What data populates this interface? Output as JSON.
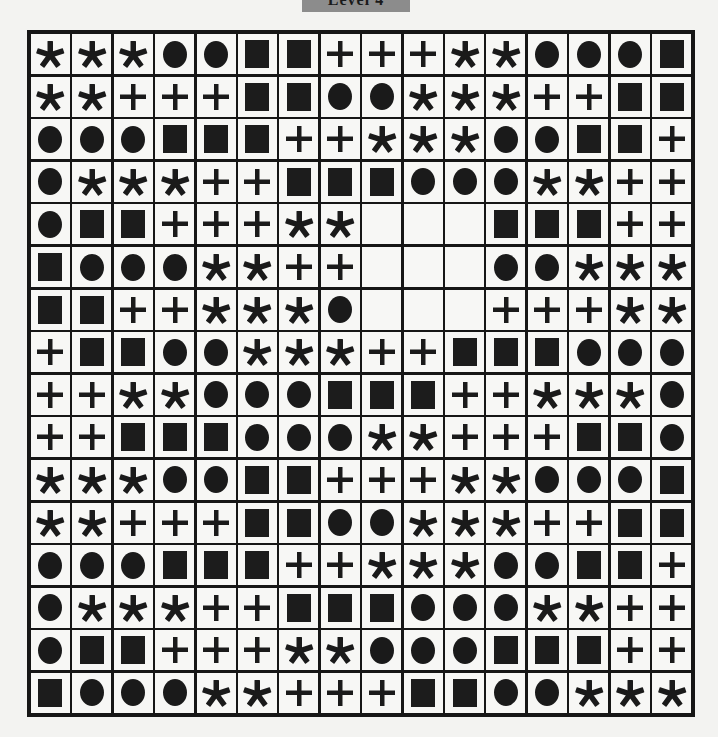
{
  "header": {
    "level_label": "Level 4"
  },
  "board": {
    "rows": 16,
    "cols": 16,
    "legend": {
      "C": "circle",
      "S": "square",
      "P": "plus",
      "A": "asterisk",
      "_": "empty"
    },
    "grid": [
      [
        "A",
        "A",
        "A",
        "C",
        "C",
        "S",
        "S",
        "P",
        "P",
        "P",
        "A",
        "A",
        "C",
        "C",
        "C",
        "S"
      ],
      [
        "A",
        "A",
        "P",
        "P",
        "P",
        "S",
        "S",
        "C",
        "C",
        "A",
        "A",
        "A",
        "P",
        "P",
        "S",
        "S"
      ],
      [
        "C",
        "C",
        "C",
        "S",
        "S",
        "S",
        "P",
        "P",
        "A",
        "A",
        "A",
        "C",
        "C",
        "S",
        "S",
        "P"
      ],
      [
        "C",
        "A",
        "A",
        "A",
        "P",
        "P",
        "S",
        "S",
        "S",
        "C",
        "C",
        "C",
        "A",
        "A",
        "P",
        "P"
      ],
      [
        "C",
        "S",
        "S",
        "P",
        "P",
        "P",
        "A",
        "A",
        "_",
        "_",
        "_",
        "S",
        "S",
        "S",
        "P",
        "P"
      ],
      [
        "S",
        "C",
        "C",
        "C",
        "A",
        "A",
        "P",
        "P",
        "_",
        "_",
        "_",
        "C",
        "C",
        "A",
        "A",
        "A"
      ],
      [
        "S",
        "S",
        "P",
        "P",
        "A",
        "A",
        "A",
        "C",
        "_",
        "_",
        "_",
        "P",
        "P",
        "P",
        "A",
        "A"
      ],
      [
        "P",
        "S",
        "S",
        "C",
        "C",
        "A",
        "A",
        "A",
        "P",
        "P",
        "S",
        "S",
        "S",
        "C",
        "C",
        "C"
      ],
      [
        "P",
        "P",
        "A",
        "A",
        "C",
        "C",
        "C",
        "S",
        "S",
        "S",
        "P",
        "P",
        "A",
        "A",
        "A",
        "C"
      ],
      [
        "P",
        "P",
        "S",
        "S",
        "S",
        "C",
        "C",
        "C",
        "A",
        "A",
        "P",
        "P",
        "P",
        "S",
        "S",
        "C"
      ],
      [
        "A",
        "A",
        "A",
        "C",
        "C",
        "S",
        "S",
        "P",
        "P",
        "P",
        "A",
        "A",
        "C",
        "C",
        "C",
        "S"
      ],
      [
        "A",
        "A",
        "P",
        "P",
        "P",
        "S",
        "S",
        "C",
        "C",
        "A",
        "A",
        "A",
        "P",
        "P",
        "S",
        "S"
      ],
      [
        "C",
        "C",
        "C",
        "S",
        "S",
        "S",
        "P",
        "P",
        "A",
        "A",
        "A",
        "C",
        "C",
        "S",
        "S",
        "P"
      ],
      [
        "C",
        "A",
        "A",
        "A",
        "P",
        "P",
        "S",
        "S",
        "S",
        "C",
        "C",
        "C",
        "A",
        "A",
        "P",
        "P"
      ],
      [
        "C",
        "S",
        "S",
        "P",
        "P",
        "P",
        "A",
        "A",
        "C",
        "C",
        "C",
        "S",
        "S",
        "S",
        "P",
        "P"
      ],
      [
        "S",
        "C",
        "C",
        "C",
        "A",
        "A",
        "P",
        "P",
        "P",
        "S",
        "S",
        "C",
        "C",
        "A",
        "A",
        "A"
      ]
    ],
    "missing_region": {
      "rows": [
        5,
        6,
        7
      ],
      "cols": [
        9,
        10,
        11
      ]
    }
  },
  "colors": {
    "symbol": "#1a1a1a",
    "grid_line": "#161616",
    "cell_bg": "#f7f7f5",
    "page_bg": "#f3f3f1",
    "tab_bg": "#8c8c8c"
  }
}
